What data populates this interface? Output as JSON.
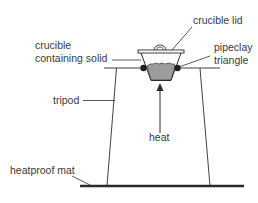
{
  "diagram": {
    "title": "",
    "type": "apparatus",
    "colors": {
      "line": "#2b2b2b",
      "text": "#3a3a3a",
      "solid_fill": "#9c9c9c",
      "pipeclay": "#1f1f1f",
      "mat": "#2b2b2b",
      "background": "#ffffff"
    },
    "labels": {
      "crucible_lid": "crucible lid",
      "crucible_line1": "crucible",
      "crucible_line2": "containing solid",
      "pipeclay_line1": "pipeclay",
      "pipeclay_line2": "triangle",
      "tripod": "tripod",
      "heat": "heat",
      "heatproof_mat": "heatproof mat"
    },
    "components": [
      {
        "name": "crucible lid",
        "icon": "lid-shape"
      },
      {
        "name": "crucible containing solid",
        "icon": "crucible-shape"
      },
      {
        "name": "pipeclay triangle",
        "icon": "triangle-support"
      },
      {
        "name": "tripod",
        "icon": "tripod-stand"
      },
      {
        "name": "heat",
        "icon": "up-arrow"
      },
      {
        "name": "heatproof mat",
        "icon": "mat-bar"
      }
    ]
  }
}
